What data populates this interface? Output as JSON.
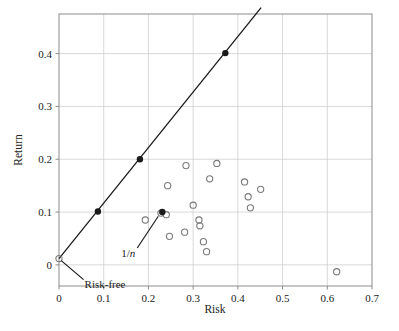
{
  "chart_data": {
    "type": "scatter",
    "title": "",
    "xlabel": "Risk",
    "ylabel": "Return",
    "xlim": [
      0.0,
      0.7
    ],
    "ylim": [
      -0.04,
      0.475
    ],
    "xticks": [
      0,
      0.1,
      0.2,
      0.3,
      0.4,
      0.5,
      0.6,
      0.7
    ],
    "xticklabels": [
      "0",
      "0.1",
      "0.2",
      "0.3",
      "0.4",
      "0.5",
      "0.6",
      "0.7"
    ],
    "yticks": [
      0,
      0.1,
      0.2,
      0.3,
      0.4
    ],
    "yticklabels": [
      "0",
      "0.1",
      "0.2",
      "0.3",
      "0.4"
    ],
    "grid": true,
    "grid_color": "#c8c8c8",
    "frame_color": "#8c8c8c",
    "marker_color": "#7a7a7a",
    "line_color": "#1a1a1a",
    "series": [
      {
        "name": "Individual assets",
        "marker": "open-circle",
        "points": [
          {
            "x": 0.193,
            "y": 0.085
          },
          {
            "x": 0.228,
            "y": 0.098
          },
          {
            "x": 0.24,
            "y": 0.095
          },
          {
            "x": 0.243,
            "y": 0.15
          },
          {
            "x": 0.247,
            "y": 0.054
          },
          {
            "x": 0.281,
            "y": 0.062
          },
          {
            "x": 0.284,
            "y": 0.188
          },
          {
            "x": 0.3,
            "y": 0.113
          },
          {
            "x": 0.313,
            "y": 0.085
          },
          {
            "x": 0.315,
            "y": 0.074
          },
          {
            "x": 0.323,
            "y": 0.044
          },
          {
            "x": 0.33,
            "y": 0.025
          },
          {
            "x": 0.337,
            "y": 0.163
          },
          {
            "x": 0.353,
            "y": 0.192
          },
          {
            "x": 0.415,
            "y": 0.157
          },
          {
            "x": 0.423,
            "y": 0.129
          },
          {
            "x": 0.428,
            "y": 0.108
          },
          {
            "x": 0.451,
            "y": 0.143
          },
          {
            "x": 0.621,
            "y": -0.013
          }
        ]
      },
      {
        "name": "Capital allocation line portfolios",
        "marker": "filled-circle",
        "points": [
          {
            "x": 0.087,
            "y": 0.101
          },
          {
            "x": 0.181,
            "y": 0.2
          },
          {
            "x": 0.372,
            "y": 0.401
          }
        ]
      },
      {
        "name": "1/n portfolio",
        "marker": "filled-circle",
        "points": [
          {
            "x": 0.231,
            "y": 0.1
          }
        ]
      },
      {
        "name": "Risk-free asset",
        "marker": "open-circle",
        "points": [
          {
            "x": 0.0,
            "y": 0.012
          }
        ]
      }
    ],
    "lines": [
      {
        "name": "capital-allocation-line",
        "from": {
          "x": 0.0,
          "y": 0.012
        },
        "to": {
          "x": 0.452,
          "y": 0.487
        }
      }
    ],
    "annotations": [
      {
        "name": "one-over-n",
        "text": "1/n",
        "text_html": "1/<span class=\"it\">n</span>",
        "label_x": 0.175,
        "label_y": 0.032,
        "target_x": 0.222,
        "target_y": 0.092
      },
      {
        "name": "risk-free",
        "text": "Risk-free",
        "text_html": "Risk-free",
        "label_x": 0.055,
        "label_y": -0.028,
        "target_x": 0.005,
        "target_y": 0.008
      }
    ]
  },
  "axes": {
    "x_title": "Risk",
    "y_title": "Return"
  }
}
